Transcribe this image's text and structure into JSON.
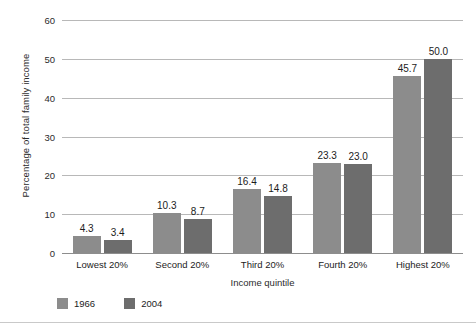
{
  "chart_data": {
    "type": "bar",
    "title": "",
    "xlabel": "Income quintile",
    "ylabel": "Percentage of total family income",
    "categories": [
      "Lowest 20%",
      "Second 20%",
      "Third 20%",
      "Fourth 20%",
      "Highest 20%"
    ],
    "series": [
      {
        "name": "1966",
        "color": "#8c8c8c",
        "values": [
          4.3,
          10.3,
          16.4,
          23.3,
          45.7
        ]
      },
      {
        "name": "2004",
        "color": "#6d6d6d",
        "values": [
          3.4,
          8.7,
          14.8,
          23.0,
          50.0
        ]
      }
    ],
    "value_labels": [
      [
        "4.3",
        "3.4"
      ],
      [
        "10.3",
        "8.7"
      ],
      [
        "16.4",
        "14.8"
      ],
      [
        "23.3",
        "23.0"
      ],
      [
        "45.7",
        "50.0"
      ]
    ],
    "ylim": [
      0,
      60
    ],
    "yticks": [
      0,
      10,
      20,
      30,
      40,
      50,
      60
    ],
    "ytick_labels": [
      "0",
      "10",
      "20",
      "30",
      "40",
      "50",
      "60"
    ],
    "grid": true,
    "grid_color": "#b8b8b8",
    "legend_position": "bottom-left",
    "background": "#ffffff"
  }
}
